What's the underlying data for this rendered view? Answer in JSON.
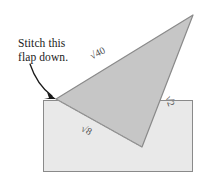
{
  "figure": {
    "kind": "geometry-diagram",
    "annotation": {
      "line1": "Stitch this",
      "line2": "flap down.",
      "arrow": "curved-arrow-icon"
    },
    "colors": {
      "triangle_fill": "#c6c6c6",
      "rectangle_fill": "#e9e9e9",
      "outline": "#8a8a8a",
      "text": "#1a1a1a",
      "label_text": "#4d4d4d"
    },
    "labels": [
      {
        "id": "hypotenuse",
        "radicand": "40",
        "symbol": "√",
        "text": "√40",
        "rotation": -27
      },
      {
        "id": "right-side",
        "radicand": "2",
        "symbol": "√",
        "text": "√2",
        "rotation": 70
      },
      {
        "id": "bottom-side",
        "radicand": "8",
        "symbol": "√",
        "text": "√8",
        "rotation": 28
      }
    ],
    "shapes": {
      "rectangle": {
        "x": 43,
        "y": 100,
        "width": 150,
        "height": 72
      },
      "triangle": {
        "points": "56,99 193,15 142,147"
      }
    }
  }
}
